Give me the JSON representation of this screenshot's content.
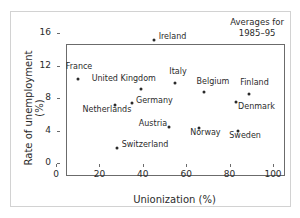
{
  "chart_data": {
    "type": "scatter",
    "title": "",
    "xlabel": "Unionization (%)",
    "ylabel": "Rate of unemployment (%)",
    "xlim": [
      0,
      100
    ],
    "ylim": [
      0,
      16
    ],
    "xticks": [
      "0",
      "20",
      "40",
      "60",
      "80",
      "100"
    ],
    "yticks": [
      "0",
      "4",
      "8",
      "12",
      "16"
    ],
    "grid": false,
    "legend": "none",
    "annotation_line1": "Averages for",
    "annotation_line2": "1985–95",
    "points": [
      {
        "label": "Ireland",
        "x": 45,
        "y": 15.2,
        "label_dx": 5,
        "label_dy": -4
      },
      {
        "label": "France",
        "x": 10,
        "y": 10.4,
        "label_dx": -12,
        "label_dy": -13
      },
      {
        "label": "United Kingdom",
        "x": 39,
        "y": 9.1,
        "label_dx": -49,
        "label_dy": -11
      },
      {
        "label": "Italy",
        "x": 55,
        "y": 9.9,
        "label_dx": -6,
        "label_dy": -12
      },
      {
        "label": "Belgium",
        "x": 68,
        "y": 8.8,
        "label_dx": -7,
        "label_dy": -11
      },
      {
        "label": "Finland",
        "x": 89,
        "y": 8.5,
        "label_dx": -9,
        "label_dy": -12
      },
      {
        "label": "Netherlands",
        "x": 27,
        "y": 7.1,
        "label_dx": -32,
        "label_dy": 4
      },
      {
        "label": "Germany",
        "x": 35,
        "y": 7.4,
        "label_dx": 4,
        "label_dy": -3
      },
      {
        "label": "Denmark",
        "x": 83,
        "y": 7.5,
        "label_dx": 2,
        "label_dy": 4
      },
      {
        "label": "Austria",
        "x": 52,
        "y": 4.4,
        "label_dx": -30,
        "label_dy": -4
      },
      {
        "label": "Norway",
        "x": 66,
        "y": 4.3,
        "label_dx": -9,
        "label_dy": 4
      },
      {
        "label": "Sweden",
        "x": 84,
        "y": 4.0,
        "label_dx": -9,
        "label_dy": 4
      },
      {
        "label": "Switzerland",
        "x": 28,
        "y": 1.9,
        "label_dx": 5,
        "label_dy": -4
      }
    ]
  }
}
